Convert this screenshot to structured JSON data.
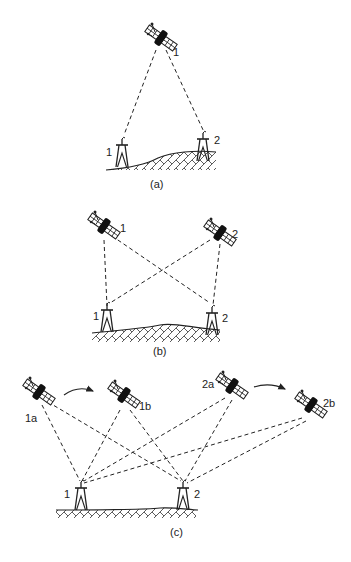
{
  "figure": {
    "panels": [
      {
        "caption": "(a)",
        "satellites": [
          {
            "label": "1",
            "x": 161,
            "y": 40
          }
        ],
        "stations": [
          {
            "label": "1",
            "x": 126,
            "y": 162
          },
          {
            "label": "2",
            "x": 206,
            "y": 156
          }
        ]
      },
      {
        "caption": "(b)",
        "satellites": [
          {
            "label": "1",
            "x": 104,
            "y": 227
          },
          {
            "label": "2",
            "x": 218,
            "y": 234
          }
        ],
        "stations": [
          {
            "label": "1",
            "x": 109,
            "y": 320
          },
          {
            "label": "2",
            "x": 210,
            "y": 323
          }
        ]
      },
      {
        "caption": "(c)",
        "satellites": [
          {
            "label": "1a",
            "x": 37,
            "y": 392
          },
          {
            "label": "1b",
            "x": 124,
            "y": 395
          },
          {
            "label": "2a",
            "x": 230,
            "y": 386
          },
          {
            "label": "2b",
            "x": 311,
            "y": 408
          }
        ],
        "stations": [
          {
            "label": "1",
            "x": 80,
            "y": 510
          },
          {
            "label": "2",
            "x": 184,
            "y": 510
          }
        ],
        "motion_arrows": [
          {
            "from": "1a",
            "to": "1b"
          },
          {
            "from": "2a",
            "to": "2b"
          }
        ]
      }
    ],
    "colors": {
      "ink": "#222222",
      "background": "#ffffff"
    }
  }
}
